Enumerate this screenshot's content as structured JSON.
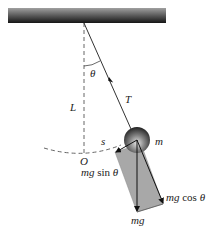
{
  "diagram": {
    "type": "simple-pendulum-force-diagram",
    "labels": {
      "theta": "θ",
      "length": "L",
      "tension": "T",
      "arc": "s",
      "origin": "O",
      "mass": "m",
      "gravity": "mg",
      "tangential_italic": "mg",
      "tangential_fn": " sin ",
      "tangential_theta": "θ",
      "radial_italic": "mg",
      "radial_fn": " cos ",
      "radial_theta": "θ"
    },
    "colors": {
      "ceiling_top": "#9a9a9a",
      "ceiling_bottom": "#1a1a1a",
      "string": "#333333",
      "dashed": "#555555",
      "parallelogram_fill": "#a8a8a8",
      "bob_light": "#d8d8d8",
      "bob_dark": "#303030"
    }
  }
}
